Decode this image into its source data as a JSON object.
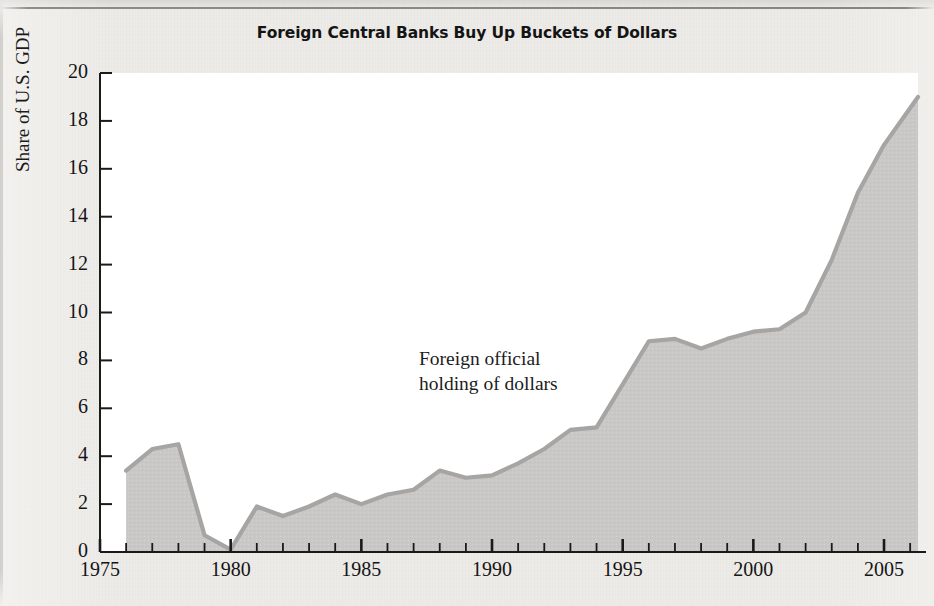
{
  "figure": {
    "title": "Foreign Central Banks Buy Up Buckets of Dollars",
    "annotation": "Foreign official\nholding of dollars",
    "colors": {
      "paper": "#eeece8",
      "plot_background": "#ffffff",
      "area_fill": "#c9c8c6",
      "series_line": "#a6a5a3",
      "axis": "#1a1a1a",
      "text": "#141414"
    }
  },
  "chart_data": {
    "type": "area",
    "title": "Foreign Central Banks Buy Up Buckets of Dollars",
    "xlabel": "",
    "ylabel": "Share of U.S. GDP",
    "xlim": [
      1975,
      2006.3
    ],
    "ylim": [
      0,
      20
    ],
    "grid": false,
    "legend_position": "inline-annotation",
    "y_ticks": [
      0,
      2,
      4,
      6,
      8,
      10,
      12,
      14,
      16,
      18,
      20
    ],
    "y_tick_labels": [
      "0",
      "2",
      "4",
      "6",
      "8",
      "10",
      "12",
      "14",
      "16",
      "18",
      "20"
    ],
    "x_major_ticks": [
      1975,
      1980,
      1985,
      1990,
      1995,
      2000,
      2005
    ],
    "x_tick_labels": [
      "1975",
      "1980",
      "1985",
      "1990",
      "1995",
      "2000",
      "2005"
    ],
    "x_minor_tick_interval": 1,
    "series": [
      {
        "name": "Foreign official holding of dollars",
        "x": [
          1976,
          1977,
          1978,
          1979,
          1980,
          1981,
          1982,
          1983,
          1984,
          1985,
          1986,
          1987,
          1988,
          1989,
          1990,
          1991,
          1992,
          1993,
          1994,
          1995,
          1996,
          1997,
          1998,
          1999,
          2000,
          2001,
          2002,
          2003,
          2004,
          2005,
          2006.3
        ],
        "values": [
          3.4,
          4.3,
          4.5,
          0.7,
          0.1,
          1.9,
          1.5,
          1.9,
          2.4,
          2.0,
          2.4,
          2.6,
          3.4,
          3.1,
          3.2,
          3.7,
          4.3,
          5.1,
          5.2,
          7.0,
          8.8,
          8.9,
          8.5,
          8.9,
          9.2,
          9.3,
          10.0,
          12.2,
          15.0,
          17.0,
          19.0
        ]
      }
    ]
  }
}
